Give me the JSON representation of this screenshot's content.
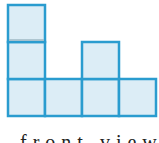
{
  "diagram": {
    "type": "square-stack-view",
    "cell_size": 37,
    "origin": {
      "x": 7,
      "y": 4
    },
    "colors": {
      "fill": "#dcedf6",
      "stroke": "#2a9ccf",
      "inner_line": "#9fb9c4"
    },
    "columns": [
      {
        "index": 0,
        "height": 3
      },
      {
        "index": 1,
        "height": 1
      },
      {
        "index": 2,
        "height": 2
      },
      {
        "index": 3,
        "height": 1
      }
    ],
    "max_height": 3
  },
  "caption": {
    "text": "front view"
  }
}
